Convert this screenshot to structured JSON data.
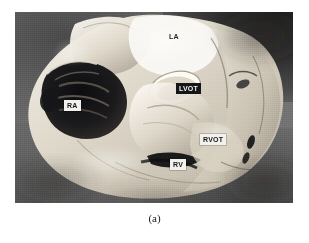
{
  "figure": {
    "caption": "(a)",
    "photo": {
      "subject": "anatomical-heart-specimen-photograph",
      "style": "grayscale-halftone-photograph",
      "background_color": "#6b6b6b",
      "tissue_color": "#e8e3da",
      "cavity_color": "#1a1a1a"
    },
    "labels": [
      {
        "id": "la",
        "text": "LA",
        "style": "plain",
        "x": 166,
        "y": 31,
        "region": "left-atrium"
      },
      {
        "id": "lvot",
        "text": "LVOT",
        "style": "boxed-dark",
        "x": 176,
        "y": 83,
        "region": "left-ventricular-outflow-tract"
      },
      {
        "id": "ra",
        "text": "RA",
        "style": "boxed-light",
        "x": 64,
        "y": 100,
        "region": "right-atrium"
      },
      {
        "id": "rvot",
        "text": "RVOT",
        "style": "boxed-light",
        "x": 200,
        "y": 134,
        "region": "right-ventricular-outflow-tract"
      },
      {
        "id": "rv",
        "text": "RV",
        "style": "boxed-light",
        "x": 170,
        "y": 159,
        "region": "right-ventricle"
      }
    ]
  }
}
